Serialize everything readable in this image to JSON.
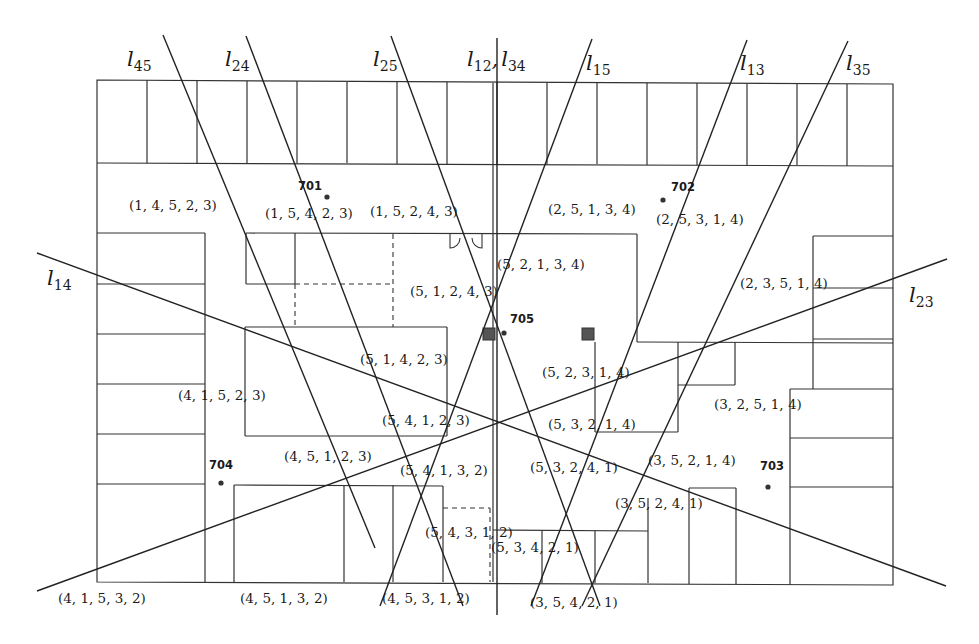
{
  "diagram": {
    "colors": {
      "ink": "#222222",
      "wall": "#333333",
      "marker": "#555555",
      "background": "#ffffff"
    },
    "floor_outline": [
      [
        97,
        80
      ],
      [
        893,
        84
      ],
      [
        893,
        585
      ],
      [
        97,
        582
      ]
    ],
    "walls": [
      [
        97,
        163,
        893,
        166
      ],
      [
        147,
        80,
        147,
        163
      ],
      [
        197,
        81,
        197,
        163
      ],
      [
        247,
        81,
        247,
        163
      ],
      [
        297,
        81,
        297,
        163
      ],
      [
        347,
        82,
        347,
        163
      ],
      [
        397,
        82,
        397,
        164
      ],
      [
        447,
        82,
        447,
        164
      ],
      [
        497,
        82,
        497,
        164
      ],
      [
        547,
        83,
        547,
        164
      ],
      [
        597,
        83,
        597,
        164
      ],
      [
        647,
        83,
        647,
        165
      ],
      [
        697,
        83,
        697,
        165
      ],
      [
        747,
        84,
        747,
        165
      ],
      [
        797,
        84,
        797,
        165
      ],
      [
        847,
        84,
        847,
        166
      ],
      [
        97,
        233,
        205,
        233
      ],
      [
        205,
        233,
        205,
        582
      ],
      [
        97,
        284,
        205,
        284
      ],
      [
        97,
        334,
        205,
        334
      ],
      [
        97,
        384,
        205,
        384
      ],
      [
        97,
        434,
        205,
        434
      ],
      [
        97,
        484,
        205,
        484
      ],
      [
        246,
        233,
        637,
        234
      ],
      [
        246,
        233,
        246,
        284
      ],
      [
        246,
        284,
        295,
        284
      ],
      [
        295,
        233,
        295,
        284
      ],
      [
        245,
        327,
        447,
        327
      ],
      [
        245,
        327,
        245,
        436
      ],
      [
        245,
        436,
        447,
        436
      ],
      [
        447,
        327,
        447,
        436
      ],
      [
        493,
        83,
        493,
        582
      ],
      [
        637,
        234,
        637,
        342
      ],
      [
        637,
        342,
        893,
        343
      ],
      [
        595,
        342,
        595,
        432
      ],
      [
        595,
        432,
        678,
        432
      ],
      [
        678,
        342,
        678,
        432
      ],
      [
        678,
        385,
        735,
        385
      ],
      [
        735,
        342,
        735,
        385
      ],
      [
        813,
        236,
        893,
        236
      ],
      [
        813,
        236,
        813,
        389
      ],
      [
        813,
        288,
        893,
        288
      ],
      [
        813,
        339,
        893,
        339
      ],
      [
        790,
        389,
        893,
        389
      ],
      [
        790,
        389,
        790,
        585
      ],
      [
        790,
        438,
        893,
        438
      ],
      [
        790,
        487,
        893,
        487
      ],
      [
        234,
        485,
        443,
        486
      ],
      [
        234,
        485,
        234,
        582
      ],
      [
        344,
        485,
        344,
        582
      ],
      [
        393,
        485,
        393,
        582
      ],
      [
        443,
        486,
        443,
        582
      ],
      [
        493,
        530,
        648,
        531
      ],
      [
        542,
        530,
        542,
        583
      ],
      [
        595,
        531,
        595,
        583
      ],
      [
        648,
        498,
        648,
        583
      ],
      [
        689,
        488,
        736,
        488
      ],
      [
        689,
        488,
        689,
        584
      ],
      [
        736,
        488,
        736,
        584
      ]
    ],
    "dashed_walls": [
      [
        295,
        284,
        393,
        284
      ],
      [
        393,
        234,
        393,
        327
      ],
      [
        295,
        284,
        295,
        327
      ],
      [
        443,
        508,
        490,
        508
      ],
      [
        490,
        508,
        490,
        582
      ]
    ],
    "door_symbol": {
      "x": 450,
      "y": 234,
      "label": "double-door"
    },
    "markers": [
      {
        "x": 489,
        "y": 334,
        "size": 12
      },
      {
        "x": 588,
        "y": 334,
        "size": 12
      }
    ],
    "bisector_lines": [
      {
        "id": "l45",
        "label": "l",
        "sub": "45",
        "x1": 163,
        "y1": 35,
        "x2": 375,
        "y2": 548,
        "lx": 127,
        "ly": 66
      },
      {
        "id": "l24",
        "label": "l",
        "sub": "24",
        "x1": 246,
        "y1": 36,
        "x2": 463,
        "y2": 606,
        "lx": 225,
        "ly": 66
      },
      {
        "id": "l25",
        "label": "l",
        "sub": "25",
        "x1": 391,
        "y1": 36,
        "x2": 600,
        "y2": 606,
        "lx": 373,
        "ly": 66
      },
      {
        "id": "l12_l34",
        "label": "l",
        "sub": "12",
        "label2": "l",
        "sub2": "34",
        "x1": 497,
        "y1": 38,
        "x2": 497,
        "y2": 615,
        "lx": 467,
        "ly": 66
      },
      {
        "id": "l15",
        "label": "l",
        "sub": "15",
        "x1": 592,
        "y1": 39,
        "x2": 380,
        "y2": 606,
        "lx": 586,
        "ly": 70
      },
      {
        "id": "l13",
        "label": "l",
        "sub": "13",
        "x1": 747,
        "y1": 40,
        "x2": 531,
        "y2": 606,
        "lx": 740,
        "ly": 70
      },
      {
        "id": "l35",
        "label": "l",
        "sub": "35",
        "x1": 848,
        "y1": 41,
        "x2": 582,
        "y2": 606,
        "lx": 846,
        "ly": 70
      },
      {
        "id": "l14",
        "label": "l",
        "sub": "14",
        "x1": 37,
        "y1": 253,
        "x2": 946,
        "y2": 586,
        "lx": 47,
        "ly": 285
      },
      {
        "id": "l23",
        "label": "l",
        "sub": "23",
        "x1": 37,
        "y1": 591,
        "x2": 947,
        "y2": 259,
        "lx": 909,
        "ly": 302
      }
    ],
    "access_points": [
      {
        "id": "701",
        "label": "701",
        "x": 327,
        "y": 197,
        "lx": 298,
        "ly": 190
      },
      {
        "id": "702",
        "label": "702",
        "x": 663,
        "y": 200,
        "lx": 671,
        "ly": 191
      },
      {
        "id": "703",
        "label": "703",
        "x": 768,
        "y": 487,
        "lx": 760,
        "ly": 470
      },
      {
        "id": "704",
        "label": "704",
        "x": 221,
        "y": 483,
        "lx": 209,
        "ly": 469
      },
      {
        "id": "705",
        "label": "705",
        "x": 504,
        "y": 333,
        "lx": 510,
        "ly": 323
      }
    ],
    "region_labels": [
      {
        "text": "(1, 4, 5, 2, 3)",
        "x": 129,
        "y": 210
      },
      {
        "text": "(1, 5, 4, 2, 3)",
        "x": 265,
        "y": 218
      },
      {
        "text": "(1, 5, 2, 4, 3)",
        "x": 370,
        "y": 216
      },
      {
        "text": "(2, 5, 1, 3, 4)",
        "x": 548,
        "y": 214
      },
      {
        "text": "(2, 5, 3, 1, 4)",
        "x": 656,
        "y": 224
      },
      {
        "text": "(5, 2, 1, 3, 4)",
        "x": 497,
        "y": 269
      },
      {
        "text": "(2, 3, 5, 1, 4)",
        "x": 740,
        "y": 288
      },
      {
        "text": "(5, 1, 2, 4, 3)",
        "x": 410,
        "y": 296
      },
      {
        "text": "(5, 1, 4, 2, 3)",
        "x": 360,
        "y": 364
      },
      {
        "text": "(5, 2, 3, 1, 4)",
        "x": 542,
        "y": 377
      },
      {
        "text": "(4, 1, 5, 2, 3)",
        "x": 178,
        "y": 400
      },
      {
        "text": "(3, 2, 5, 1, 4)",
        "x": 714,
        "y": 409
      },
      {
        "text": "(5, 4, 1, 2, 3)",
        "x": 382,
        "y": 425
      },
      {
        "text": "(5, 3, 2, 1, 4)",
        "x": 548,
        "y": 429
      },
      {
        "text": "(4, 5, 1, 2, 3)",
        "x": 284,
        "y": 461
      },
      {
        "text": "(5, 4, 1, 3, 2)",
        "x": 400,
        "y": 475
      },
      {
        "text": "(5, 3, 2, 4, 1)",
        "x": 530,
        "y": 472
      },
      {
        "text": "(3, 5, 2, 1, 4)",
        "x": 648,
        "y": 465
      },
      {
        "text": "(3, 5, 2, 4, 1)",
        "x": 615,
        "y": 508
      },
      {
        "text": "(5, 4, 3, 1, 2)",
        "x": 425,
        "y": 537
      },
      {
        "text": "(5, 3, 4, 2, 1)",
        "x": 491,
        "y": 552
      },
      {
        "text": "(4, 1, 5, 3, 2)",
        "x": 58,
        "y": 603
      },
      {
        "text": "(4, 5, 1, 3, 2)",
        "x": 240,
        "y": 603
      },
      {
        "text": "(4, 5, 3, 1, 2)",
        "x": 382,
        "y": 603
      },
      {
        "text": "(3, 5, 4, 2, 1)",
        "x": 530,
        "y": 607
      }
    ]
  }
}
